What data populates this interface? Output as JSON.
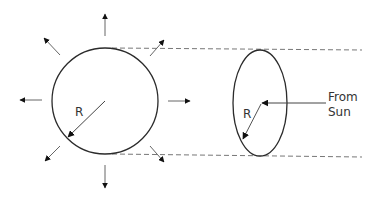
{
  "diagram": {
    "sun": {
      "shape": "circle",
      "radius_label": "R",
      "radial_arrows": [
        "up",
        "up-right",
        "right",
        "down-right",
        "down",
        "down-left",
        "left",
        "up-left"
      ]
    },
    "earth_cross_section": {
      "shape": "ellipse",
      "radius_label": "R"
    },
    "incoming_arrow": {
      "label_line1": "From",
      "label_line2": "Sun"
    },
    "dashed_lines": [
      "top-tangent",
      "bottom-tangent"
    ],
    "colors": {
      "outline": "#2b2b2b",
      "arrow": "#555555",
      "dashed": "#777777",
      "text": "#333333"
    }
  }
}
